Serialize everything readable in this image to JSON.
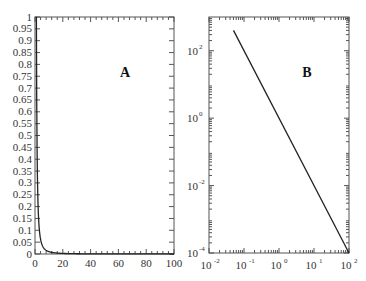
{
  "chart_data": [
    {
      "panel": "A",
      "type": "line",
      "title": "",
      "annotation": "A",
      "xlabel": "",
      "ylabel": "",
      "xlim": [
        0,
        100
      ],
      "ylim": [
        0,
        1
      ],
      "x_scale": "linear",
      "y_scale": "linear",
      "x_ticks": [
        "0",
        "20",
        "40",
        "60",
        "80",
        "100"
      ],
      "y_ticks": [
        "0",
        "0.05",
        "0.1",
        "0.15",
        "0.2",
        "0.25",
        "0.3",
        "0.35",
        "0.4",
        "0.45",
        "0.5",
        "0.55",
        "0.6",
        "0.65",
        "0.7",
        "0.75",
        "0.8",
        "0.85",
        "0.9",
        "0.95",
        "1"
      ],
      "grid": false,
      "series": [
        {
          "name": "curve",
          "x": [
            1,
            1.2,
            1.5,
            2,
            2.5,
            3,
            4,
            5,
            7,
            10,
            15,
            20,
            30,
            50,
            100
          ],
          "y": [
            1,
            0.694,
            0.444,
            0.25,
            0.16,
            0.111,
            0.0625,
            0.04,
            0.0204,
            0.01,
            0.0044,
            0.0025,
            0.0011,
            0.0004,
            0.0001
          ]
        }
      ]
    },
    {
      "panel": "B",
      "type": "line",
      "title": "",
      "annotation": "B",
      "xlabel": "",
      "ylabel": "",
      "xlim": [
        0.01,
        100
      ],
      "ylim": [
        0.0001,
        1000
      ],
      "x_scale": "log",
      "y_scale": "log",
      "x_ticks": [
        "10^-2",
        "10^-1",
        "10^0",
        "10^1",
        "10^2"
      ],
      "y_ticks": [
        "10^-4",
        "10^-2",
        "10^0",
        "10^2"
      ],
      "grid": false,
      "series": [
        {
          "name": "curve",
          "x": [
            0.05,
            100
          ],
          "y": [
            400,
            0.0001
          ]
        }
      ]
    }
  ],
  "panels": {
    "a": {
      "label": "A",
      "x_ticks": [
        "0",
        "20",
        "40",
        "60",
        "80",
        "100"
      ],
      "y_ticks": [
        "0",
        "0.05",
        "0.1",
        "0.15",
        "0.2",
        "0.25",
        "0.3",
        "0.35",
        "0.4",
        "0.45",
        "0.5",
        "0.55",
        "0.6",
        "0.65",
        "0.7",
        "0.75",
        "0.8",
        "0.85",
        "0.9",
        "0.95",
        "1"
      ]
    },
    "b": {
      "label": "B",
      "x_ticks": [
        {
          "base": "10",
          "exp": "-2"
        },
        {
          "base": "10",
          "exp": "-1"
        },
        {
          "base": "10",
          "exp": "0"
        },
        {
          "base": "10",
          "exp": "1"
        },
        {
          "base": "10",
          "exp": "2"
        }
      ],
      "y_ticks": [
        {
          "base": "10",
          "exp": "2"
        },
        {
          "base": "10",
          "exp": "0"
        },
        {
          "base": "10",
          "exp": "-2"
        },
        {
          "base": "10",
          "exp": "-4"
        }
      ]
    }
  }
}
